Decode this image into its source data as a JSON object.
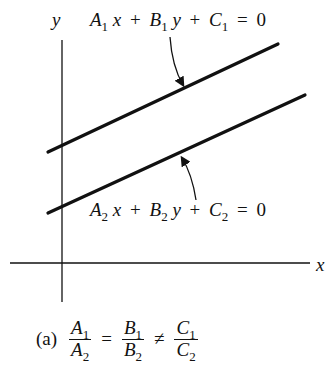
{
  "figure": {
    "axes": {
      "x_label": "x",
      "y_label": "y"
    },
    "lines": [
      {
        "id": "line-1",
        "equation": {
          "A": "A",
          "A_sub": "1",
          "x": "x",
          "B": "B",
          "B_sub": "1",
          "y": "y",
          "C": "C",
          "C_sub": "1",
          "plus": "+",
          "eq": "=",
          "rhs": "0"
        }
      },
      {
        "id": "line-2",
        "equation": {
          "A": "A",
          "A_sub": "2",
          "x": "x",
          "B": "B",
          "B_sub": "2",
          "y": "y",
          "C": "C",
          "C_sub": "2",
          "plus": "+",
          "eq": "=",
          "rhs": "0"
        }
      }
    ],
    "caption": {
      "tag": "(a)",
      "frac1": {
        "num": "A",
        "num_sub": "1",
        "den": "A",
        "den_sub": "2"
      },
      "rel1": "=",
      "frac2": {
        "num": "B",
        "num_sub": "1",
        "den": "B",
        "den_sub": "2"
      },
      "rel2": "≠",
      "frac3": {
        "num": "C",
        "num_sub": "1",
        "den": "C",
        "den_sub": "2"
      }
    },
    "colors": {
      "ink": "#111111",
      "background": "#ffffff"
    }
  }
}
